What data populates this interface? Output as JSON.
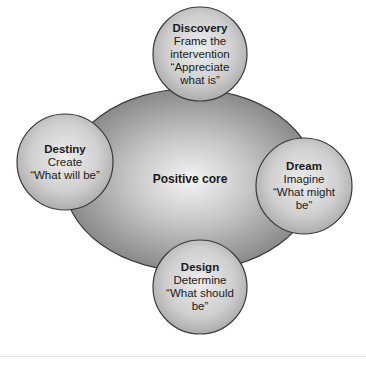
{
  "diagram": {
    "core": {
      "label": "Positive core"
    },
    "nodes": [
      {
        "id": "discovery",
        "title": "Discovery",
        "lines": [
          "Frame the",
          "intervention",
          "“Appreciate",
          "what is”"
        ]
      },
      {
        "id": "dream",
        "title": "Dream",
        "lines": [
          "Imagine",
          "“What might",
          "be”"
        ]
      },
      {
        "id": "design",
        "title": "Design",
        "lines": [
          "Determine",
          "“What should",
          "be”"
        ]
      },
      {
        "id": "destiny",
        "title": "Destiny",
        "lines": [
          "Create",
          "“What will be”"
        ]
      }
    ],
    "colors": {
      "core_center": "#f2f2f2",
      "core_edge": "#7a7a7a",
      "node_center": "#eeeeee",
      "node_edge": "#a6a6a6",
      "outline": "#3a3a3a",
      "text": "#1a1a1a"
    }
  }
}
